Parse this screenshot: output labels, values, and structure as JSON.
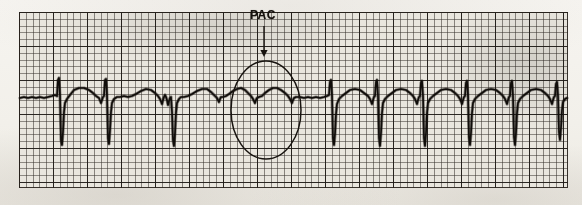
{
  "figure": {
    "name": "ecg-rhythm-strip",
    "kind": "scanned-ecg-paper",
    "paper_color": "#f4f2ee",
    "grid_color": "#e9e6de",
    "trace_color": "#100d0a",
    "annotation_color": "#17130f"
  },
  "annotations": {
    "pac_label": "PAC",
    "arrow": {
      "name": "pac-arrow",
      "direction": "down",
      "x": 264,
      "y_start": 26,
      "y_end": 57
    },
    "circle": {
      "name": "pac-highlight-ellipse",
      "cx": 266,
      "cy": 110,
      "rx": 35,
      "ry": 49
    }
  },
  "grid": {
    "left": 19,
    "top": 12,
    "width": 549,
    "height": 176,
    "minor_spacing_px": 6.8,
    "major_spacing_px": 34
  },
  "chart_data": {
    "type": "line",
    "title": "PAC",
    "xlabel": "",
    "ylabel": "",
    "grid": true,
    "legend": "none",
    "baseline_y": 97,
    "xlim": [
      19,
      568
    ],
    "ylim": [
      12,
      188
    ],
    "annotation_text": "PAC",
    "series": [
      {
        "name": "ecg-lead-trace",
        "points": [
          [
            20,
            98
          ],
          [
            24,
            97
          ],
          [
            28,
            98
          ],
          [
            32,
            97
          ],
          [
            36,
            98
          ],
          [
            40,
            97
          ],
          [
            44,
            98
          ],
          [
            48,
            97
          ],
          [
            52,
            96
          ],
          [
            55,
            95
          ],
          [
            57,
            96
          ],
          [
            58,
            80
          ],
          [
            59,
            78
          ],
          [
            60,
            96
          ],
          [
            61,
            140
          ],
          [
            62,
            145
          ],
          [
            63,
            132
          ],
          [
            64,
            112
          ],
          [
            65,
            103
          ],
          [
            67,
            99
          ],
          [
            70,
            95
          ],
          [
            74,
            90
          ],
          [
            79,
            88
          ],
          [
            84,
            88
          ],
          [
            89,
            90
          ],
          [
            93,
            93
          ],
          [
            96,
            96
          ],
          [
            99,
            98
          ],
          [
            101,
            103
          ],
          [
            102,
            100
          ],
          [
            103,
            97
          ],
          [
            104,
            96
          ],
          [
            105,
            80
          ],
          [
            106,
            79
          ],
          [
            107,
            96
          ],
          [
            108,
            138
          ],
          [
            109,
            144
          ],
          [
            110,
            130
          ],
          [
            111,
            112
          ],
          [
            112,
            103
          ],
          [
            114,
            99
          ],
          [
            117,
            97
          ],
          [
            120,
            97
          ],
          [
            124,
            96
          ],
          [
            128,
            97
          ],
          [
            132,
            96
          ],
          [
            136,
            94
          ],
          [
            141,
            91
          ],
          [
            146,
            89
          ],
          [
            151,
            90
          ],
          [
            155,
            93
          ],
          [
            158,
            96
          ],
          [
            160,
            99
          ],
          [
            162,
            104
          ],
          [
            163,
            100
          ],
          [
            164,
            97
          ],
          [
            165,
            95
          ],
          [
            166,
            97
          ],
          [
            167,
            100
          ],
          [
            168,
            105
          ],
          [
            169,
            101
          ],
          [
            170,
            98
          ],
          [
            171,
            97
          ],
          [
            172,
            112
          ],
          [
            173,
            140
          ],
          [
            174,
            146
          ],
          [
            175,
            133
          ],
          [
            176,
            113
          ],
          [
            177,
            103
          ],
          [
            179,
            99
          ],
          [
            181,
            97
          ],
          [
            184,
            97
          ],
          [
            188,
            96
          ],
          [
            192,
            94
          ],
          [
            197,
            91
          ],
          [
            202,
            89
          ],
          [
            207,
            89
          ],
          [
            211,
            92
          ],
          [
            214,
            95
          ],
          [
            217,
            98
          ],
          [
            219,
            102
          ],
          [
            220,
            99
          ],
          [
            221,
            97
          ],
          [
            223,
            97
          ],
          [
            226,
            96
          ],
          [
            229,
            94
          ],
          [
            233,
            91
          ],
          [
            237,
            89
          ],
          [
            241,
            88
          ],
          [
            245,
            90
          ],
          [
            248,
            93
          ],
          [
            251,
            96
          ],
          [
            253,
            99
          ],
          [
            255,
            103
          ],
          [
            256,
            100
          ],
          [
            257,
            98
          ],
          [
            259,
            97
          ],
          [
            262,
            96
          ],
          [
            265,
            93
          ],
          [
            269,
            90
          ],
          [
            273,
            88
          ],
          [
            277,
            88
          ],
          [
            281,
            90
          ],
          [
            285,
            93
          ],
          [
            288,
            96
          ],
          [
            290,
            99
          ],
          [
            292,
            103
          ],
          [
            293,
            100
          ],
          [
            294,
            98
          ],
          [
            296,
            97
          ],
          [
            300,
            97
          ],
          [
            304,
            98
          ],
          [
            308,
            97
          ],
          [
            312,
            98
          ],
          [
            316,
            97
          ],
          [
            320,
            98
          ],
          [
            324,
            97
          ],
          [
            327,
            96
          ],
          [
            329,
            95
          ],
          [
            330,
            82
          ],
          [
            331,
            80
          ],
          [
            332,
            96
          ],
          [
            333,
            138
          ],
          [
            334,
            145
          ],
          [
            335,
            134
          ],
          [
            336,
            114
          ],
          [
            337,
            104
          ],
          [
            339,
            99
          ],
          [
            342,
            96
          ],
          [
            346,
            93
          ],
          [
            350,
            90
          ],
          [
            355,
            89
          ],
          [
            360,
            90
          ],
          [
            364,
            93
          ],
          [
            368,
            96
          ],
          [
            370,
            99
          ],
          [
            372,
            104
          ],
          [
            373,
            100
          ],
          [
            374,
            97
          ],
          [
            375,
            96
          ],
          [
            376,
            82
          ],
          [
            377,
            80
          ],
          [
            378,
            96
          ],
          [
            379,
            138
          ],
          [
            380,
            146
          ],
          [
            381,
            133
          ],
          [
            382,
            113
          ],
          [
            383,
            103
          ],
          [
            385,
            99
          ],
          [
            388,
            96
          ],
          [
            392,
            93
          ],
          [
            396,
            90
          ],
          [
            401,
            89
          ],
          [
            406,
            90
          ],
          [
            410,
            93
          ],
          [
            413,
            96
          ],
          [
            415,
            99
          ],
          [
            417,
            104
          ],
          [
            418,
            100
          ],
          [
            419,
            97
          ],
          [
            420,
            96
          ],
          [
            421,
            83
          ],
          [
            422,
            81
          ],
          [
            423,
            96
          ],
          [
            424,
            138
          ],
          [
            425,
            146
          ],
          [
            426,
            133
          ],
          [
            427,
            113
          ],
          [
            428,
            103
          ],
          [
            430,
            99
          ],
          [
            433,
            96
          ],
          [
            437,
            93
          ],
          [
            441,
            90
          ],
          [
            446,
            89
          ],
          [
            451,
            90
          ],
          [
            455,
            93
          ],
          [
            458,
            96
          ],
          [
            460,
            99
          ],
          [
            462,
            104
          ],
          [
            463,
            100
          ],
          [
            464,
            97
          ],
          [
            465,
            96
          ],
          [
            466,
            83
          ],
          [
            467,
            81
          ],
          [
            468,
            96
          ],
          [
            469,
            137
          ],
          [
            470,
            145
          ],
          [
            471,
            133
          ],
          [
            472,
            113
          ],
          [
            473,
            103
          ],
          [
            475,
            99
          ],
          [
            478,
            96
          ],
          [
            482,
            93
          ],
          [
            486,
            90
          ],
          [
            491,
            89
          ],
          [
            496,
            90
          ],
          [
            500,
            93
          ],
          [
            503,
            96
          ],
          [
            505,
            99
          ],
          [
            507,
            104
          ],
          [
            508,
            100
          ],
          [
            509,
            97
          ],
          [
            510,
            96
          ],
          [
            511,
            83
          ],
          [
            512,
            81
          ],
          [
            513,
            96
          ],
          [
            514,
            137
          ],
          [
            515,
            145
          ],
          [
            516,
            133
          ],
          [
            517,
            113
          ],
          [
            518,
            103
          ],
          [
            520,
            99
          ],
          [
            523,
            96
          ],
          [
            527,
            93
          ],
          [
            531,
            90
          ],
          [
            536,
            89
          ],
          [
            541,
            90
          ],
          [
            545,
            93
          ],
          [
            548,
            96
          ],
          [
            550,
            99
          ],
          [
            552,
            104
          ],
          [
            553,
            100
          ],
          [
            554,
            97
          ],
          [
            555,
            96
          ],
          [
            556,
            84
          ],
          [
            557,
            82
          ],
          [
            558,
            96
          ],
          [
            559,
            132
          ],
          [
            560,
            140
          ],
          [
            561,
            128
          ],
          [
            562,
            110
          ],
          [
            563,
            102
          ],
          [
            565,
            99
          ],
          [
            567,
            98
          ]
        ]
      }
    ]
  }
}
